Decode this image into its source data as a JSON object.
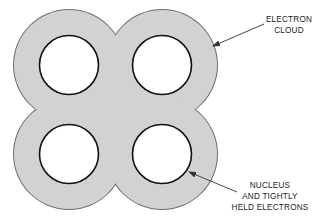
{
  "diagram": {
    "colors": {
      "cloud_fill": "#d2d2d2",
      "cloud_outline": "#6e6e6e",
      "nucleus_fill": "#ffffff",
      "nucleus_outline": "#111111",
      "leader_line": "#333333",
      "text": "#222222"
    },
    "nuclei_count": 4,
    "labels": {
      "electron_cloud": [
        "ELECTRON",
        "CLOUD"
      ],
      "nucleus": [
        "NUCLEUS",
        "AND TIGHTLY",
        "HELD ELECTRONS"
      ]
    }
  }
}
